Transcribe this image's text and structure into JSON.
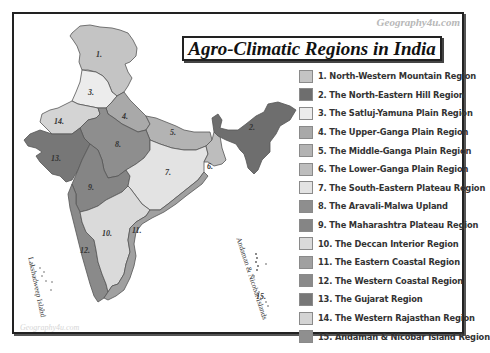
{
  "watermark_top": "Geography4u.com",
  "watermark_bottom": "Geography4u.com",
  "title": "Agro-Climatic Regions in India",
  "island_labels": {
    "lakshadweep": "Lakshadweep Island",
    "andaman": "Andaman & Nicobar Islands"
  },
  "regions": [
    {
      "num": "1.",
      "label": "1. North-Western Mountain Region",
      "color": "#c4c4c4"
    },
    {
      "num": "2.",
      "label": "2. The North-Eastern Hill Region",
      "color": "#6e6e6e"
    },
    {
      "num": "3.",
      "label": "3. The Satluj-Yamuna Plain Region",
      "color": "#ececec"
    },
    {
      "num": "4.",
      "label": "4. The Upper-Ganga Plain Region",
      "color": "#a9a9a9"
    },
    {
      "num": "5.",
      "label": "5. The Middle-Ganga Plain Region",
      "color": "#b3b3b3"
    },
    {
      "num": "6.",
      "label": "6. The Lower-Ganga Plain Region",
      "color": "#bdbdbd"
    },
    {
      "num": "7.",
      "label": "7. The South-Eastern Plateau Region",
      "color": "#e3e3e3"
    },
    {
      "num": "8.",
      "label": "8. The Aravali-Malwa Upland",
      "color": "#8e8e8e"
    },
    {
      "num": "9.",
      "label": "9. The Maharashtra Plateau Region",
      "color": "#858585"
    },
    {
      "num": "10.",
      "label": "10. The Deccan Interior Region",
      "color": "#dadada"
    },
    {
      "num": "11.",
      "label": "11. The Eastern Coastal Region",
      "color": "#a0a0a0"
    },
    {
      "num": "12.",
      "label": "12. The Western Coastal Region",
      "color": "#8a8a8a"
    },
    {
      "num": "13.",
      "label": "13. The Gujarat Region",
      "color": "#777777"
    },
    {
      "num": "14.",
      "label": "14. The Western Rajasthan Region",
      "color": "#d4d4d4"
    },
    {
      "num": "15.",
      "label": "15. Andaman & Nicobar Island Region",
      "color": "#8f8f8f"
    }
  ]
}
